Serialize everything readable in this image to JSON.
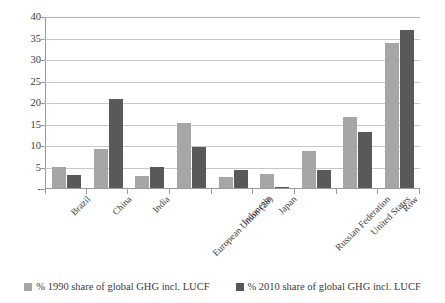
{
  "chart_data": {
    "type": "bar",
    "title": "",
    "subtitle": "",
    "xlabel": "",
    "ylabel": "",
    "ylim": [
      0,
      40
    ],
    "ytick_step": 5,
    "ytick_labels": [
      "40",
      "35",
      "30",
      "25",
      "20",
      "15",
      "10",
      "5",
      "-"
    ],
    "ytick_values": [
      40,
      35,
      30,
      25,
      20,
      15,
      10,
      5,
      0
    ],
    "grid": true,
    "legend_position": "bottom",
    "categories": [
      "Brazil",
      "China",
      "India",
      "European Union (28)",
      "Indonesia",
      "Japan",
      "Russian Federation",
      "United States",
      "Row"
    ],
    "series": [
      {
        "name": "% 1990 share of global GHG incl. LUCF",
        "color": "#a6a6a6",
        "values": [
          5.0,
          9.0,
          2.7,
          15.2,
          2.5,
          3.2,
          8.7,
          16.5,
          33.7
        ]
      },
      {
        "name": "% 2010 share of global GHG incl. LUCF",
        "color": "#595959",
        "values": [
          3.0,
          20.7,
          5.0,
          9.6,
          4.3,
          0.2,
          4.2,
          13.0,
          36.7
        ]
      }
    ]
  },
  "colors": {
    "series1": "#a6a6a6",
    "series2": "#595959",
    "gridline": "#c8c8c8",
    "axis": "#9a9a9a",
    "text": "#3b3b3b",
    "background": "#ffffff"
  }
}
